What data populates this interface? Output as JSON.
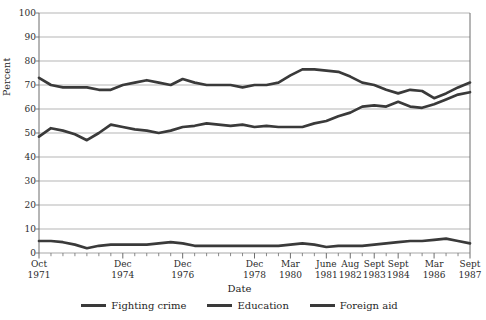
{
  "chart_data": {
    "type": "line",
    "title": "",
    "xlabel": "Date",
    "ylabel": "Percent",
    "ylim": [
      0,
      100
    ],
    "ytick_values": [
      0,
      10,
      20,
      30,
      40,
      50,
      60,
      70,
      80,
      90,
      100
    ],
    "grid": true,
    "legend_position": "bottom",
    "x_tick_labels": [
      {
        "line1": "Oct",
        "line2": "1971"
      },
      {
        "line1": "Dec",
        "line2": "1974"
      },
      {
        "line1": "Dec",
        "line2": "1976"
      },
      {
        "line1": "Dec",
        "line2": "1978"
      },
      {
        "line1": "Mar",
        "line2": "1980"
      },
      {
        "line1": "June",
        "line2": "1981"
      },
      {
        "line1": "Aug",
        "line2": "1982"
      },
      {
        "line1": "Sept",
        "line2": "1983"
      },
      {
        "line1": "Sept",
        "line2": "1984"
      },
      {
        "line1": "Mar",
        "line2": "1986"
      },
      {
        "line1": "Sept",
        "line2": "1987"
      }
    ],
    "x_tick_indices": [
      0,
      7,
      12,
      18,
      21,
      24,
      26,
      28,
      30,
      33,
      36
    ],
    "n_points": 37,
    "series": [
      {
        "name": "Fighting crime",
        "color": "#3a3a3a",
        "values": [
          73,
          70,
          69,
          69,
          69,
          68,
          68,
          70,
          71,
          72,
          71,
          70,
          72.5,
          71,
          70,
          70,
          70,
          69,
          70,
          70,
          71,
          74,
          76.5,
          76.5,
          76,
          75.5,
          73.5,
          71,
          70,
          68,
          66.5,
          68,
          67.5,
          64.5,
          66.5,
          69,
          71
        ]
      },
      {
        "name": "Education",
        "color": "#3a3a3a",
        "values": [
          48.5,
          52,
          51,
          49.5,
          47,
          50,
          53.5,
          52.5,
          51.5,
          51,
          50,
          51,
          52.5,
          53,
          54,
          53.5,
          53,
          53.5,
          52.5,
          53,
          52.5,
          52.5,
          52.5,
          54,
          55,
          57,
          58.5,
          61,
          61.5,
          61,
          63,
          61,
          60.5,
          62,
          64,
          66,
          67
        ]
      },
      {
        "name": "Foreign aid",
        "color": "#3a3a3a",
        "values": [
          5,
          5,
          4.5,
          3.5,
          2,
          3,
          3.5,
          3.5,
          3.5,
          3.5,
          4,
          4.5,
          4,
          3,
          3,
          3,
          3,
          3,
          3,
          3,
          3,
          3.5,
          4,
          3.5,
          2.5,
          3,
          3,
          3,
          3.5,
          4,
          4.5,
          5,
          5,
          5.5,
          6,
          5,
          4
        ]
      }
    ]
  },
  "axes": {
    "y_label": "Percent",
    "x_label": "Date"
  },
  "legend": {
    "items": [
      {
        "label": "Fighting crime"
      },
      {
        "label": "Education"
      },
      {
        "label": "Foreign aid"
      }
    ]
  },
  "style": {
    "line_color": "#3a3a3a",
    "grid_color": "#a8a8a8",
    "axis_color": "#6d6d6d",
    "text_color": "#1f1f1f"
  }
}
